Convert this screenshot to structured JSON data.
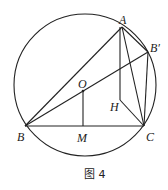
{
  "figure": {
    "caption": "图 4",
    "points": {
      "A": {
        "label": "A",
        "x": 122,
        "y": 27
      },
      "B_prime": {
        "label": "B′",
        "x": 148,
        "y": 52
      },
      "O": {
        "label": "O",
        "x": 84,
        "y": 91
      },
      "B": {
        "label": "B",
        "x": 25,
        "y": 126
      },
      "C": {
        "label": "C",
        "x": 144,
        "y": 126
      },
      "M": {
        "label": "M",
        "x": 83,
        "y": 126
      },
      "H": {
        "label": "H",
        "x": 120,
        "y": 100
      }
    },
    "circle": {
      "cx": 85,
      "cy": 85,
      "r": 71
    },
    "line_color": "#222222"
  }
}
